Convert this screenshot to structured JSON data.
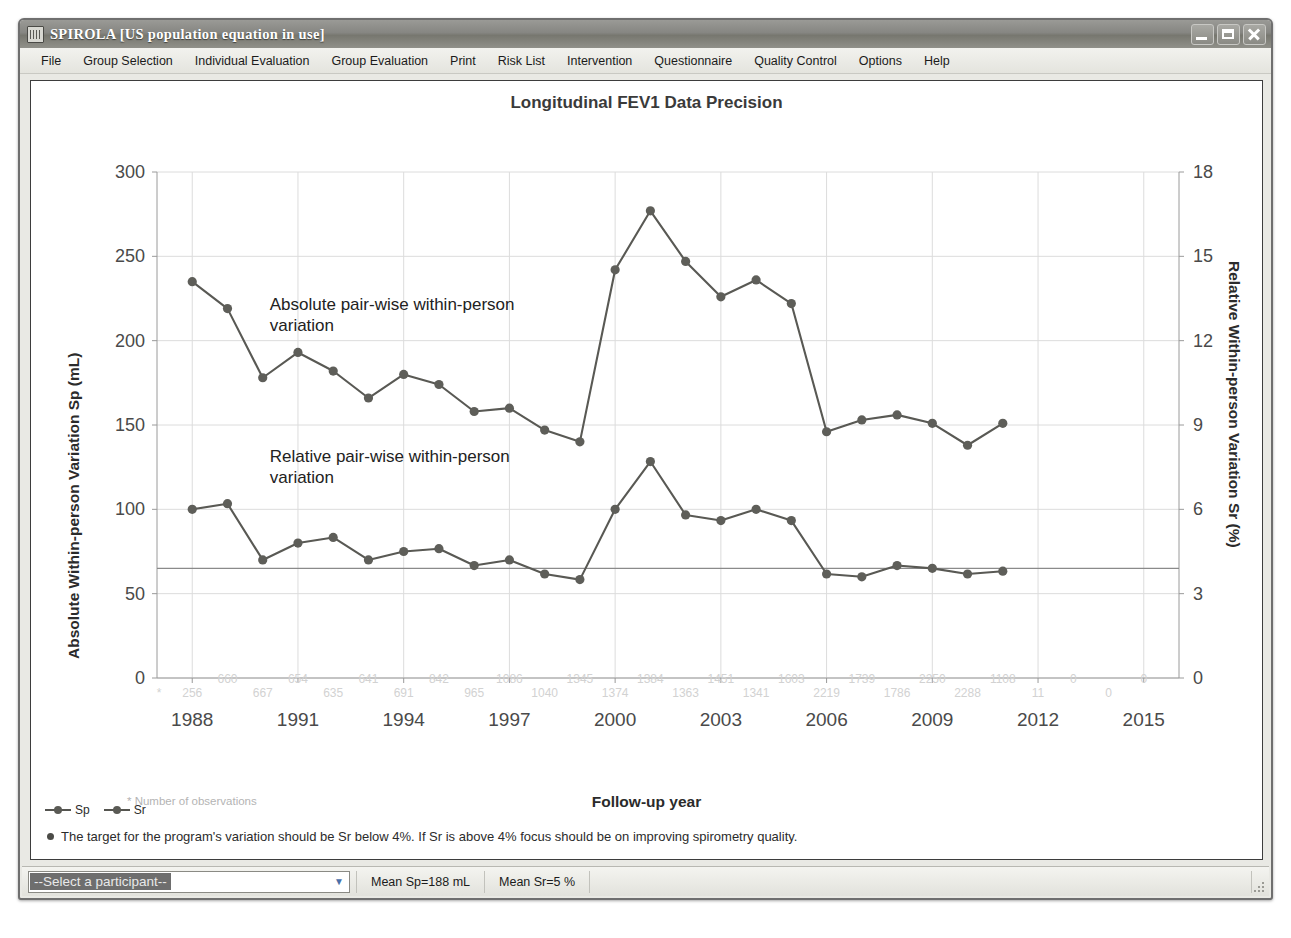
{
  "window": {
    "title": "SPIROLA  [US population equation in use]",
    "icon": "app-icon",
    "buttons": {
      "minimize": "minimize",
      "maximize": "maximize",
      "close": "close"
    }
  },
  "menubar": {
    "items": [
      "File",
      "Group Selection",
      "Individual Evaluation",
      "Group Evaluation",
      "Print",
      "Risk List",
      "Intervention",
      "Questionnaire",
      "Quality Control",
      "Options",
      "Help"
    ]
  },
  "legend": {
    "items": [
      "Sp",
      "Sr"
    ]
  },
  "target_note": "The target for the program's variation should be Sr below 4%. If Sr is above 4% focus should be on improving spirometry quality.",
  "statusbar": {
    "participant_selected": "--Select a participant--",
    "mean_sp": "Mean Sp=188 mL",
    "mean_sr": "Mean Sr=5 %"
  },
  "chart_data": {
    "type": "line",
    "title": "Longitudinal FEV1 Data Precision",
    "xlabel": "Follow-up year",
    "ylabel": "Absolute Within-person Variation Sp (mL)",
    "y2label": "Relative Within-person Variation Sr (%)",
    "obs_footnote": "* Number of observations",
    "grid": true,
    "legend_position": "below-left",
    "xlim": [
      1987,
      2016
    ],
    "xticks": [
      1988,
      1991,
      1994,
      1997,
      2000,
      2003,
      2006,
      2009,
      2012,
      2015
    ],
    "ylim": [
      0,
      300
    ],
    "yticks": [
      0,
      50,
      100,
      150,
      200,
      250,
      300
    ],
    "y2lim": [
      0,
      18
    ],
    "y2ticks": [
      0,
      3,
      6,
      9,
      12,
      15,
      18
    ],
    "reference_line": {
      "sp": 65,
      "sr": 4
    },
    "annotations": [
      {
        "text": "Absolute pair-wise within-person variation",
        "x": 1990.2,
        "y": 218
      },
      {
        "text": "Relative pair-wise within-person variation",
        "x": 1990.2,
        "y": 128
      }
    ],
    "x": [
      1988,
      1989,
      1990,
      1991,
      1992,
      1993,
      1994,
      1995,
      1996,
      1997,
      1998,
      1999,
      2000,
      2001,
      2002,
      2003,
      2004,
      2005,
      2006,
      2007,
      2008,
      2009,
      2010,
      2011
    ],
    "series": [
      {
        "name": "Sp",
        "unit": "mL",
        "values": [
          235,
          219,
          178,
          193,
          182,
          166,
          180,
          174,
          158,
          160,
          147,
          140,
          242,
          277,
          247,
          226,
          236,
          222,
          146,
          153,
          156,
          151,
          138,
          151
        ]
      },
      {
        "name": "Sr",
        "unit": "%",
        "values": [
          6.0,
          6.2,
          4.2,
          4.8,
          5.0,
          4.2,
          4.5,
          4.6,
          4.0,
          4.2,
          3.7,
          3.5,
          6.0,
          7.7,
          5.8,
          5.6,
          6.0,
          5.6,
          3.7,
          3.6,
          4.0,
          3.9,
          3.7,
          3.8
        ]
      }
    ],
    "observations": {
      "label": "Number of observations",
      "top_row": [
        null,
        660,
        null,
        654,
        null,
        641,
        null,
        842,
        null,
        1086,
        null,
        1345,
        null,
        1384,
        null,
        1451,
        null,
        1603,
        null,
        1739,
        null,
        2250,
        null,
        1108,
        null,
        0,
        null,
        0
      ],
      "bottom_row": [
        256,
        null,
        667,
        null,
        635,
        null,
        691,
        null,
        965,
        null,
        1040,
        null,
        1374,
        null,
        1363,
        null,
        1341,
        null,
        2219,
        null,
        1786,
        null,
        2288,
        null,
        11,
        null,
        0,
        null
      ],
      "years": [
        1988,
        1989,
        1990,
        1991,
        1992,
        1993,
        1994,
        1995,
        1996,
        1997,
        1998,
        1999,
        2000,
        2001,
        2002,
        2003,
        2004,
        2005,
        2006,
        2007,
        2008,
        2009,
        2010,
        2011,
        2012,
        2013,
        2014,
        2015
      ]
    }
  }
}
